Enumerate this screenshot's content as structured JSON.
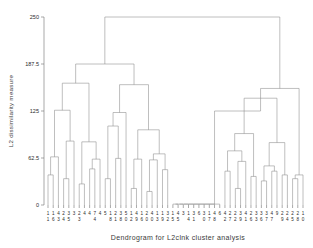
{
  "figure": {
    "top_clipped_text": "",
    "xlabel": "Dendrogram for L2clnk cluster analysis",
    "ylabel": "L2 dissimilarity measure"
  },
  "axis": {
    "y_ticks": [
      "0",
      "62.5",
      "125",
      "187.5",
      "250"
    ],
    "y_tick_values": [
      0,
      62.5,
      125,
      187.5,
      250
    ]
  },
  "chart_data": {
    "type": "dendrogram",
    "title": "",
    "xlabel": "Dendrogram for L2clnk cluster analysis",
    "ylabel": "L2 dissimilarity measure",
    "ylim": [
      0,
      250
    ],
    "yticks": [
      0,
      62.5,
      125,
      187.5,
      250
    ],
    "grid": false,
    "legend": "none",
    "n_leaves": 50,
    "leaf_labels": [
      "11",
      "16",
      "14",
      "23",
      "23",
      "35",
      "32",
      "44",
      "47",
      "43",
      "45",
      "61",
      "23",
      "45",
      "14",
      "12",
      "41",
      "13",
      "14",
      "33",
      "14",
      "12",
      "46",
      "41",
      "13",
      "13",
      "14",
      "33",
      "13",
      "14",
      "43",
      "11",
      "35",
      "46",
      "31",
      "40",
      "46",
      "47",
      "42",
      "28",
      "22",
      "37",
      "34",
      "21",
      "29",
      "33",
      "31",
      "36",
      "34",
      "97",
      "49",
      "27",
      "22",
      "29",
      "22",
      "14",
      "21",
      "95",
      "80"
    ],
    "leaf_labels_top": [
      "1",
      "1",
      "4",
      "2",
      "3",
      "3",
      "2",
      "4",
      "4",
      "7",
      "4",
      "5",
      "1",
      "2",
      "3",
      "5",
      "1",
      "4",
      "1",
      "2",
      "4",
      "1",
      "1",
      "3",
      "1",
      "4",
      "3",
      "1",
      "3",
      "6",
      "3",
      "1",
      "4",
      "6",
      "4",
      "2",
      "2",
      "3",
      "4",
      "2",
      "3",
      "3",
      "3",
      "4",
      "9",
      "2",
      "2",
      "2",
      "2",
      "1"
    ],
    "leaf_labels_bottom": [
      "1",
      "6",
      "3",
      "4",
      "5",
      "",
      "3",
      "",
      "",
      "4",
      "",
      "",
      "8",
      "1",
      "8",
      "0",
      "2",
      "9",
      "6",
      "0",
      "0",
      "3",
      "9",
      "2",
      "5",
      "5",
      "",
      "4",
      "1",
      "",
      "0",
      "7",
      "8",
      "",
      "2",
      "7",
      "2",
      "9",
      "1",
      "6",
      "3",
      "6",
      "7",
      "7",
      "",
      "9",
      "4",
      "5",
      "8",
      "0"
    ],
    "merges": [
      {
        "height": 250,
        "note": "root merge joining left super-cluster and right super-cluster"
      },
      {
        "height": 187.5,
        "note": "left super-cluster split"
      },
      {
        "height": 162,
        "note": "left-A cluster"
      },
      {
        "height": 160,
        "note": "left-B cluster"
      },
      {
        "height": 155,
        "note": "right super-cluster split"
      },
      {
        "height": 142,
        "note": "right-inner cluster"
      },
      {
        "height": 126,
        "note": "left-A1"
      },
      {
        "height": 123,
        "note": "left-B1"
      },
      {
        "height": 125,
        "note": "right-A"
      },
      {
        "height": 105,
        "note": "left-B1a"
      },
      {
        "height": 102,
        "note": "right-mid"
      },
      {
        "height": 100,
        "note": "left-B2"
      },
      {
        "height": 95,
        "note": "right-B"
      },
      {
        "height": 88,
        "note": "left-A2"
      },
      {
        "height": 85,
        "note": "left-A3"
      },
      {
        "height": 83,
        "note": "right-B1"
      },
      {
        "height": 72,
        "note": "right-mid-a"
      },
      {
        "height": 70,
        "note": "left-B3"
      },
      {
        "height": 68,
        "note": "left-mid-d"
      },
      {
        "height": 64,
        "note": "left-A1a"
      },
      {
        "height": 62,
        "note": "left-mid-e"
      },
      {
        "height": 61,
        "note": "mid-cluster"
      },
      {
        "height": 60,
        "note": "right-C"
      },
      {
        "height": 58,
        "note": "right-D"
      },
      {
        "height": 52,
        "note": "right-E"
      },
      {
        "height": 50,
        "note": "left-small"
      },
      {
        "height": 48,
        "note": "mid-small"
      },
      {
        "height": 45,
        "note": "right-small"
      },
      {
        "height": 40,
        "note": "leaf-pair"
      },
      {
        "height": 38,
        "note": "leaf-pair"
      },
      {
        "height": 35,
        "note": "leaf-pair"
      },
      {
        "height": 32,
        "note": "leaf-pair"
      },
      {
        "height": 28,
        "note": "leaf-pair"
      },
      {
        "height": 22,
        "note": "leaf-pair"
      },
      {
        "height": 18,
        "note": "leaf-pair"
      },
      {
        "height": 12,
        "note": "leaf-pair"
      },
      {
        "height": 1.5,
        "note": "near-zero flat cluster of identical observations"
      }
    ]
  }
}
